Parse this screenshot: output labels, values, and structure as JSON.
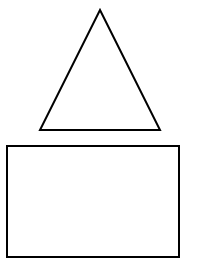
{
  "page": {
    "width": 217,
    "height": 268,
    "background_color": "#FFFFFF"
  },
  "figure": {
    "stroke_color": "#000000",
    "fill_color": "none",
    "shapes": [
      {
        "name": "triangle",
        "kind": "triangle",
        "label": "Triangle",
        "points": "100,10 160,130 40,130",
        "vertices": [
          {
            "x": 100,
            "y": 10
          },
          {
            "x": 160,
            "y": 130
          },
          {
            "x": 40,
            "y": 130
          }
        ],
        "base_width": 120,
        "height": 120,
        "stroke_width": 2,
        "stroke_color": "#000000",
        "fill": "none"
      },
      {
        "name": "rectangle",
        "kind": "rectangle",
        "label": "Rectangle",
        "x": 7,
        "y": 146,
        "width": 172,
        "height": 111,
        "stroke_width": 2,
        "stroke_color": "#000000",
        "fill": "none"
      }
    ]
  }
}
